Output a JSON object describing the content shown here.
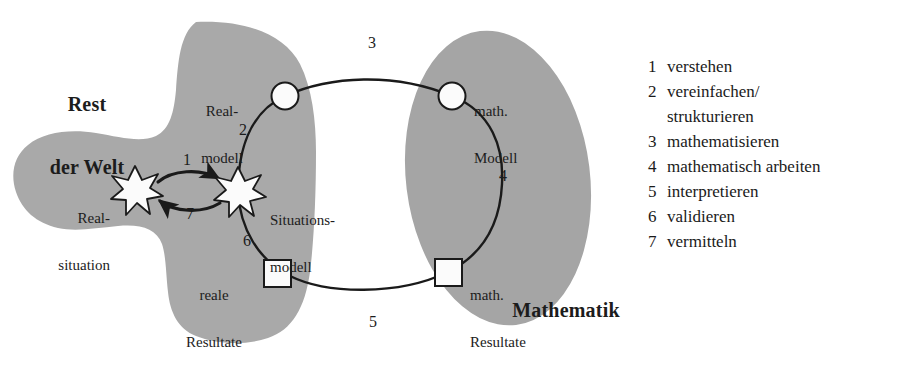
{
  "diagram": {
    "colors": {
      "region_fill": "#a9a9a9",
      "region_fill_alt": "#a5a5a5",
      "stroke": "#1a1a1a",
      "node_fill": "#fbfbfb",
      "background": "#ffffff",
      "text": "#1c1c1c"
    },
    "regions": [
      {
        "id": "rest-der-welt",
        "label_line1": "Rest",
        "label_line2": "der Welt"
      },
      {
        "id": "mathematik",
        "label": "Mathematik"
      }
    ],
    "nodes": [
      {
        "id": "real-situation",
        "shape": "star",
        "label_line1": "Real-",
        "label_line2": "situation"
      },
      {
        "id": "situations-modell",
        "shape": "star",
        "label_line1": "Situations-",
        "label_line2": "modell"
      },
      {
        "id": "real-modell",
        "shape": "circle",
        "label_line1": "Real-",
        "label_line2": "modell"
      },
      {
        "id": "math-modell",
        "shape": "circle",
        "label_line1": "math.",
        "label_line2": "Modell"
      },
      {
        "id": "reale-resultate",
        "shape": "square",
        "label_line1": "reale",
        "label_line2": "Resultate"
      },
      {
        "id": "math-resultate",
        "shape": "square",
        "label_line1": "math.",
        "label_line2": "Resultate"
      }
    ],
    "edge_numbers": {
      "e1": "1",
      "e2": "2",
      "e3": "3",
      "e4": "4",
      "e5": "5",
      "e6": "6",
      "e7": "7"
    }
  },
  "legend": {
    "items": [
      {
        "num": "1",
        "text": "verstehen",
        "cont": ""
      },
      {
        "num": "2",
        "text": "vereinfachen/",
        "cont": "strukturieren"
      },
      {
        "num": "3",
        "text": "mathematisieren",
        "cont": ""
      },
      {
        "num": "4",
        "text": "mathematisch arbeiten",
        "cont": ""
      },
      {
        "num": "5",
        "text": "interpretieren",
        "cont": ""
      },
      {
        "num": "6",
        "text": "validieren",
        "cont": ""
      },
      {
        "num": "7",
        "text": "vermitteln",
        "cont": ""
      }
    ]
  }
}
